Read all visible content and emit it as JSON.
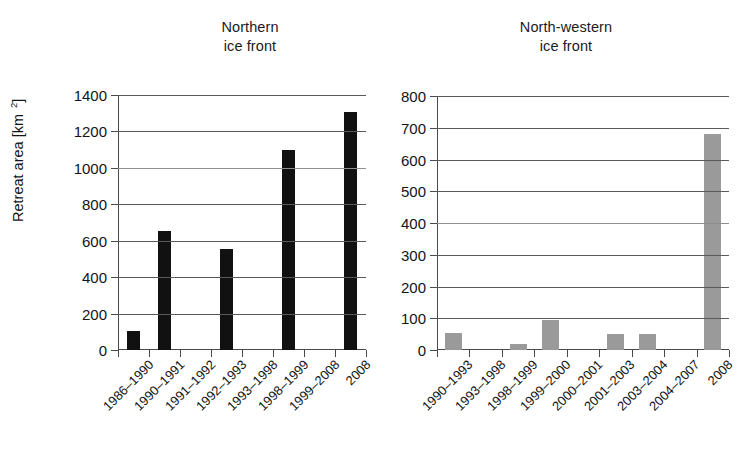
{
  "figure": {
    "y_axis_title_prefix": "Retreat area [km",
    "y_axis_title_exponent": "2",
    "y_axis_title_suffix": "]"
  },
  "panels": [
    {
      "id": "north",
      "title_line1": "Northern",
      "title_line2": "ice front"
    },
    {
      "id": "north-western",
      "title_line1": "North-western",
      "title_line2": "ice front"
    }
  ],
  "chart_data": [
    {
      "type": "bar",
      "title": "Northern ice front",
      "xlabel": "",
      "ylabel": "Retreat area [km 2]",
      "ylim": [
        0,
        1400
      ],
      "yticks": [
        0,
        200,
        400,
        600,
        800,
        1000,
        1200,
        1400
      ],
      "ytick_labels": [
        "0",
        "200",
        "400",
        "600",
        "800",
        "1000",
        "1200",
        "1400"
      ],
      "grid": true,
      "legend": "none",
      "bar_color": "#111111",
      "categories": [
        "1986-1990",
        "1990-1991",
        "1991-1992",
        "1992-1993",
        "1993-1998",
        "1998-1999",
        "1999-2008",
        "2008"
      ],
      "values": [
        105,
        655,
        0,
        555,
        0,
        1100,
        0,
        1305
      ]
    },
    {
      "type": "bar",
      "title": "North-western ice front",
      "xlabel": "",
      "ylabel": "Retreat area [km 2]",
      "ylim": [
        0,
        800
      ],
      "yticks": [
        0,
        100,
        200,
        300,
        400,
        500,
        600,
        700,
        800
      ],
      "ytick_labels": [
        "0",
        "100",
        "200",
        "300",
        "400",
        "500",
        "600",
        "700",
        "800"
      ],
      "grid": true,
      "legend": "none",
      "bar_color": "#9a9a9a",
      "categories": [
        "1990-1993",
        "1993-1998",
        "1998-1999",
        "1999-2000",
        "2000-2001",
        "2001-2003",
        "2003-2004",
        "2004-2007",
        "2008"
      ],
      "values": [
        55,
        0,
        18,
        93,
        0,
        50,
        50,
        0,
        680
      ]
    }
  ]
}
